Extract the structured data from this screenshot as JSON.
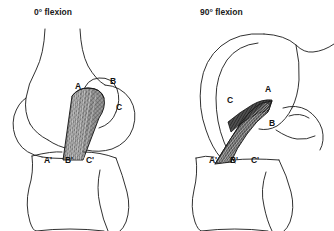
{
  "figure": {
    "type": "anatomical-diagram",
    "background_color": "#ffffff",
    "ink_color": "#1a1a1a",
    "graft_fill_color": "#8a8a8a",
    "graft_dark_color": "#3a3a3a"
  },
  "panels": [
    {
      "id": "left",
      "title": "0° flexion",
      "femoral_labels": [
        {
          "text": "A",
          "x": 78,
          "y": 89
        },
        {
          "text": "B",
          "x": 113,
          "y": 84
        },
        {
          "text": "C",
          "x": 119,
          "y": 110
        }
      ],
      "tibial_labels": [
        {
          "text": "A'",
          "x": 48,
          "y": 163
        },
        {
          "text": "B'",
          "x": 69,
          "y": 163
        },
        {
          "text": "C'",
          "x": 90,
          "y": 163
        }
      ]
    },
    {
      "id": "right",
      "title": "90° flexion",
      "femoral_labels": [
        {
          "text": "C",
          "x": 230,
          "y": 103
        },
        {
          "text": "A",
          "x": 268,
          "y": 92
        },
        {
          "text": "B",
          "x": 272,
          "y": 126
        }
      ],
      "tibial_labels": [
        {
          "text": "A'",
          "x": 213,
          "y": 163
        },
        {
          "text": "B'",
          "x": 234,
          "y": 163
        },
        {
          "text": "C'",
          "x": 255,
          "y": 163
        }
      ]
    }
  ]
}
